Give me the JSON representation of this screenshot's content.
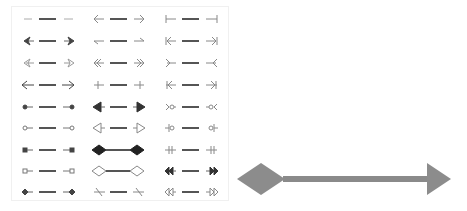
{
  "figure": {
    "colors": {
      "glyph": "#555555",
      "line": "#666666",
      "big_arrow": "#8c8c8c",
      "panel_border": "#eeeeee"
    },
    "columns": [
      {
        "rows": [
          {
            "start": "none",
            "end": "none"
          },
          {
            "start": "stealth-filled",
            "end": "stealth-filled"
          },
          {
            "start": "stealth-open",
            "end": "stealth-open"
          },
          {
            "start": "arrow-open",
            "end": "arrow-open"
          },
          {
            "start": "dot-filled",
            "end": "dot-filled"
          },
          {
            "start": "dot-open",
            "end": "dot-open"
          },
          {
            "start": "square-filled",
            "end": "square-filled"
          },
          {
            "start": "square-open",
            "end": "square-open"
          },
          {
            "start": "diamond-small-filled",
            "end": "diamond-small-filled"
          }
        ]
      },
      {
        "rows": [
          {
            "start": "arrow-line",
            "end": "arrow-line"
          },
          {
            "start": "half-arrow",
            "end": "half-arrow"
          },
          {
            "start": "double-arrow-line",
            "end": "double-arrow-line"
          },
          {
            "start": "cross-bar",
            "end": "cross-bar"
          },
          {
            "start": "triangle-filled",
            "end": "triangle-filled"
          },
          {
            "start": "triangle-open",
            "end": "triangle-open"
          },
          {
            "start": "diamond-filled",
            "end": "diamond-filled"
          },
          {
            "start": "diamond-open",
            "end": "diamond-open"
          },
          {
            "start": "slash",
            "end": "slash"
          }
        ]
      },
      {
        "rows": [
          {
            "start": "bar",
            "end": "bar"
          },
          {
            "start": "arrow-bar",
            "end": "arrow-bar"
          },
          {
            "start": "reverse-arrow",
            "end": "reverse-arrow"
          },
          {
            "start": "arrow-cross",
            "end": "arrow-cross"
          },
          {
            "start": "fork-circle",
            "end": "fork-circle"
          },
          {
            "start": "circle-bar",
            "end": "circle-bar"
          },
          {
            "start": "double-bar",
            "end": "double-bar"
          },
          {
            "start": "double-triangle-filled",
            "end": "double-triangle-filled"
          },
          {
            "start": "double-triangle-open",
            "end": "double-triangle-open"
          }
        ]
      }
    ],
    "example_arrow": {
      "start": "diamond",
      "end": "triangle"
    },
    "caption": ""
  }
}
